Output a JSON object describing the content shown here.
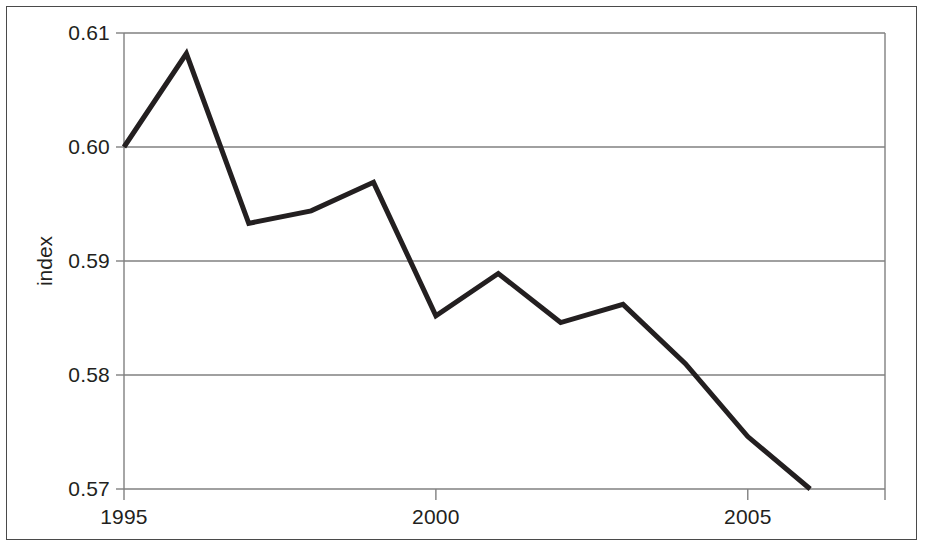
{
  "chart_data": {
    "type": "line",
    "title": "",
    "subtitle": "",
    "xlabel": "",
    "ylabel": "index",
    "x": [
      1995,
      1996,
      1997,
      1998,
      1999,
      2000,
      2001,
      2002,
      2003,
      2004,
      2005,
      2006
    ],
    "values": [
      0.6,
      0.6082,
      0.5933,
      0.5944,
      0.5969,
      0.5852,
      0.5889,
      0.5846,
      0.5862,
      0.581,
      0.5746,
      0.57
    ],
    "series": [
      {
        "name": "index",
        "values": [
          0.6,
          0.6082,
          0.5933,
          0.5944,
          0.5969,
          0.5852,
          0.5889,
          0.5846,
          0.5862,
          0.581,
          0.5746,
          0.57
        ]
      }
    ],
    "xlim": [
      1995,
      2007.2
    ],
    "ylim": [
      0.57,
      0.61
    ],
    "x_ticks": [
      1995,
      2000,
      2005
    ],
    "x_tick_labels": [
      "1995",
      "2000",
      "2005"
    ],
    "x_minor_ticks": [
      1995,
      1996,
      1997,
      1998,
      1999,
      2000,
      2001,
      2002,
      2003,
      2004,
      2005,
      2006,
      2007
    ],
    "y_ticks": [
      0.57,
      0.58,
      0.59,
      0.6,
      0.61
    ],
    "y_tick_labels": [
      "0.57",
      "0.58",
      "0.59",
      "0.60",
      "0.61"
    ],
    "grid": true,
    "grid_axis": "y",
    "legend": false,
    "legend_position": "none",
    "line_color": "#231f20",
    "line_width": 5,
    "grid_color": "#808080",
    "axis_color": "#808080",
    "frame_color": "#4a4a4a",
    "background_color": "#ffffff",
    "annotations": []
  },
  "axes": {
    "y_title": "index",
    "y_tick_labels": [
      "0.61",
      "0.60",
      "0.59",
      "0.58",
      "0.57"
    ],
    "x_tick_labels": [
      "1995",
      "2000",
      "2005"
    ]
  }
}
